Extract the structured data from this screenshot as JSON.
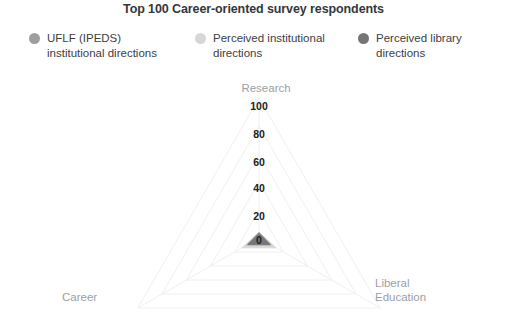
{
  "chart_title": "Top 100 Career-oriented survey respondents",
  "legend": {
    "items": [
      {
        "label": "UFLF (IPEDS)\ninstitutional directions",
        "color": "#9e9e9e",
        "marker": "legend-dot-icon"
      },
      {
        "label": "Perceived institutional\ndirections",
        "color": "#d7d7d7",
        "marker": "legend-dot-icon"
      },
      {
        "label": "Perceived library\ndirections",
        "color": "#757575",
        "marker": "legend-dot-icon"
      }
    ]
  },
  "chart_data": {
    "type": "radar",
    "title": "Top 100 Career-oriented survey respondents",
    "categories": [
      "Research",
      "Career",
      "Liberal Education"
    ],
    "tick_labels": [
      "100",
      "80",
      "60",
      "40",
      "20",
      "0"
    ],
    "axis_range": [
      0,
      100
    ],
    "axis_inverted": true,
    "grid": true,
    "legend_position": "top",
    "series": [
      {
        "name": "UFLF (IPEDS) institutional directions",
        "color": "#9e9e9e",
        "values": [
          4,
          10,
          10
        ]
      },
      {
        "name": "Perceived institutional directions",
        "color": "#d7d7d7",
        "values": [
          4,
          14,
          14
        ]
      },
      {
        "name": "Perceived library directions",
        "color": "#757575",
        "values": [
          3,
          9,
          9
        ]
      }
    ],
    "axis_labels": {
      "top": "Research",
      "bottom_left": "Career",
      "bottom_right": "Liberal\nEducation"
    }
  },
  "ticks": [
    {
      "value": "100",
      "y": 32
    },
    {
      "value": "80",
      "y": 60
    },
    {
      "value": "60",
      "y": 88
    },
    {
      "value": "40",
      "y": 114
    },
    {
      "value": "20",
      "y": 142
    },
    {
      "value": "0",
      "y": 166
    }
  ],
  "colors": {
    "series_1": "#9e9e9e",
    "series_2": "#d7d7d7",
    "series_3": "#757575",
    "grid": "#f0f0ee",
    "axis_text": "#9aa0a6",
    "tick_text": "#202124",
    "title_text": "#33373b"
  }
}
